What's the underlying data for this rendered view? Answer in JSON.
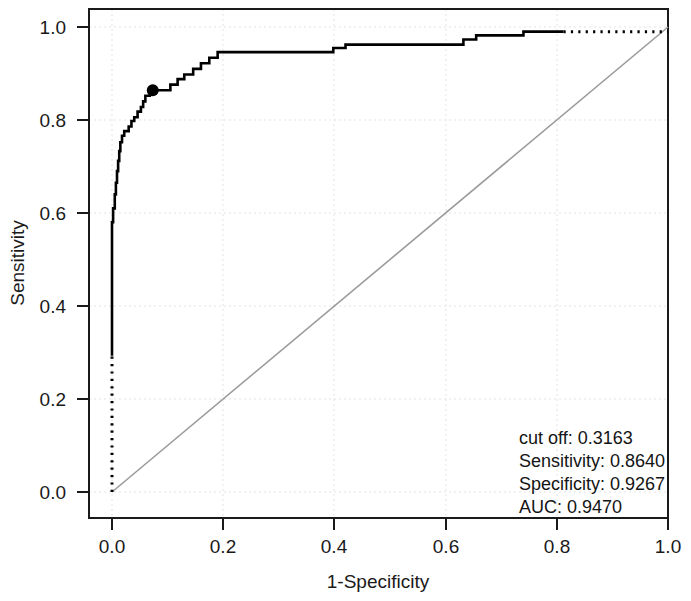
{
  "chart_data": {
    "type": "line",
    "title": "",
    "xlabel": "1-Specificity",
    "ylabel": "Sensitivity",
    "xlim": [
      0.0,
      1.0
    ],
    "ylim": [
      0.0,
      1.0
    ],
    "grid": true,
    "xticks": [
      "0.0",
      "0.2",
      "0.4",
      "0.6",
      "0.8",
      "1.0"
    ],
    "xtick_values": [
      0.0,
      0.2,
      0.4,
      0.6,
      0.8,
      1.0
    ],
    "yticks": [
      "0.0",
      "0.2",
      "0.4",
      "0.6",
      "0.8",
      "1.0"
    ],
    "ytick_values": [
      0.0,
      0.2,
      0.4,
      0.6,
      0.8,
      1.0
    ],
    "series": [
      {
        "name": "ROC curve",
        "style": "step-solid",
        "color": "#000000",
        "points": [
          [
            0.0,
            0.293
          ],
          [
            0.0,
            0.58
          ],
          [
            0.002,
            0.58
          ],
          [
            0.002,
            0.61
          ],
          [
            0.005,
            0.61
          ],
          [
            0.005,
            0.64
          ],
          [
            0.007,
            0.64
          ],
          [
            0.007,
            0.665
          ],
          [
            0.009,
            0.665
          ],
          [
            0.009,
            0.69
          ],
          [
            0.011,
            0.69
          ],
          [
            0.011,
            0.712
          ],
          [
            0.013,
            0.712
          ],
          [
            0.013,
            0.733
          ],
          [
            0.015,
            0.733
          ],
          [
            0.015,
            0.752
          ],
          [
            0.018,
            0.752
          ],
          [
            0.018,
            0.766
          ],
          [
            0.022,
            0.766
          ],
          [
            0.022,
            0.776
          ],
          [
            0.03,
            0.776
          ],
          [
            0.03,
            0.786
          ],
          [
            0.035,
            0.786
          ],
          [
            0.035,
            0.798
          ],
          [
            0.04,
            0.798
          ],
          [
            0.04,
            0.806
          ],
          [
            0.046,
            0.806
          ],
          [
            0.046,
            0.818
          ],
          [
            0.052,
            0.818
          ],
          [
            0.052,
            0.828
          ],
          [
            0.056,
            0.828
          ],
          [
            0.056,
            0.84
          ],
          [
            0.06,
            0.84
          ],
          [
            0.06,
            0.852
          ],
          [
            0.068,
            0.852
          ],
          [
            0.068,
            0.864
          ],
          [
            0.074,
            0.864
          ],
          [
            0.105,
            0.864
          ],
          [
            0.105,
            0.876
          ],
          [
            0.118,
            0.876
          ],
          [
            0.118,
            0.888
          ],
          [
            0.13,
            0.888
          ],
          [
            0.13,
            0.898
          ],
          [
            0.146,
            0.898
          ],
          [
            0.146,
            0.91
          ],
          [
            0.16,
            0.91
          ],
          [
            0.16,
            0.922
          ],
          [
            0.175,
            0.922
          ],
          [
            0.175,
            0.934
          ],
          [
            0.19,
            0.934
          ],
          [
            0.19,
            0.946
          ],
          [
            0.398,
            0.946
          ],
          [
            0.398,
            0.955
          ],
          [
            0.42,
            0.955
          ],
          [
            0.42,
            0.962
          ],
          [
            0.632,
            0.962
          ],
          [
            0.632,
            0.973
          ],
          [
            0.655,
            0.973
          ],
          [
            0.655,
            0.982
          ],
          [
            0.74,
            0.982
          ],
          [
            0.74,
            0.99
          ],
          [
            0.812,
            0.99
          ]
        ]
      },
      {
        "name": "ROC extrapolation (lower)",
        "style": "step-dotted",
        "color": "#000000",
        "points": [
          [
            0.0,
            0.0
          ],
          [
            0.0,
            0.293
          ]
        ]
      },
      {
        "name": "ROC extrapolation (upper)",
        "style": "step-dotted",
        "color": "#000000",
        "points": [
          [
            0.812,
            0.99
          ],
          [
            1.0,
            0.99
          ]
        ]
      },
      {
        "name": "Chance diagonal",
        "style": "line",
        "color": "#9b9b9b",
        "points": [
          [
            0.0,
            0.0
          ],
          [
            1.0,
            1.0
          ]
        ]
      }
    ],
    "markers": [
      {
        "name": "optimal-cutoff-point",
        "x": 0.0733,
        "y": 0.864,
        "color": "#000000"
      }
    ],
    "annotations": {
      "lines": [
        "cut off: 0.3163",
        "Sensitivity: 0.8640",
        "Specificity: 0.9267",
        "AUC: 0.9470"
      ],
      "cut_off": "0.3163",
      "sensitivity": "0.8640",
      "specificity": "0.9267",
      "auc": "0.9470"
    }
  }
}
